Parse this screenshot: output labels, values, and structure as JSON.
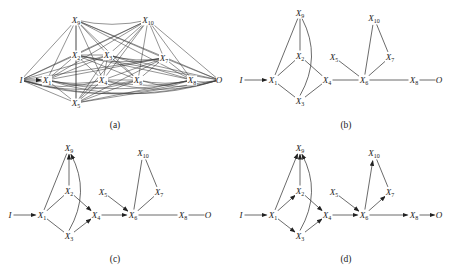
{
  "figure": {
    "panels": [
      {
        "id": "a",
        "caption": "(a)",
        "description": "fully connected graph",
        "nodes": [
          {
            "id": "I",
            "label": "I",
            "sub": ""
          },
          {
            "id": "X1",
            "label": "X",
            "sub": "1"
          },
          {
            "id": "X2",
            "label": "X",
            "sub": "2"
          },
          {
            "id": "X3",
            "label": "X",
            "sub": "3"
          },
          {
            "id": "X4",
            "label": "X",
            "sub": "4"
          },
          {
            "id": "X5",
            "label": "X",
            "sub": "5"
          },
          {
            "id": "X6",
            "label": "X",
            "sub": "6"
          },
          {
            "id": "X7",
            "label": "X",
            "sub": "7"
          },
          {
            "id": "X8",
            "label": "X",
            "sub": "8"
          },
          {
            "id": "X9",
            "label": "X",
            "sub": "9"
          },
          {
            "id": "X10",
            "label": "X",
            "sub": "10"
          },
          {
            "id": "O",
            "label": "O",
            "sub": ""
          }
        ],
        "edges": "complete",
        "directed_edges": [
          [
            "I",
            "X1"
          ]
        ]
      },
      {
        "id": "b",
        "caption": "(b)",
        "description": "undirected skeleton",
        "nodes": [
          {
            "id": "I",
            "label": "I",
            "sub": ""
          },
          {
            "id": "X1",
            "label": "X",
            "sub": "1"
          },
          {
            "id": "X2",
            "label": "X",
            "sub": "2"
          },
          {
            "id": "X3",
            "label": "X",
            "sub": "3"
          },
          {
            "id": "X4",
            "label": "X",
            "sub": "4"
          },
          {
            "id": "X5",
            "label": "X",
            "sub": "5"
          },
          {
            "id": "X6",
            "label": "X",
            "sub": "6"
          },
          {
            "id": "X7",
            "label": "X",
            "sub": "7"
          },
          {
            "id": "X8",
            "label": "X",
            "sub": "8"
          },
          {
            "id": "X9",
            "label": "X",
            "sub": "9"
          },
          {
            "id": "X10",
            "label": "X",
            "sub": "10"
          },
          {
            "id": "O",
            "label": "O",
            "sub": ""
          }
        ],
        "edges": [
          {
            "from": "I",
            "to": "X1",
            "directed": true
          },
          {
            "from": "X1",
            "to": "X9",
            "directed": false
          },
          {
            "from": "X2",
            "to": "X9",
            "directed": false
          },
          {
            "from": "X3",
            "to": "X9",
            "directed": false,
            "curved": true
          },
          {
            "from": "X1",
            "to": "X2",
            "directed": false
          },
          {
            "from": "X1",
            "to": "X3",
            "directed": false
          },
          {
            "from": "X2",
            "to": "X4",
            "directed": false
          },
          {
            "from": "X3",
            "to": "X4",
            "directed": false
          },
          {
            "from": "X4",
            "to": "X6",
            "directed": false
          },
          {
            "from": "X5",
            "to": "X6",
            "directed": false
          },
          {
            "from": "X6",
            "to": "X10",
            "directed": false
          },
          {
            "from": "X6",
            "to": "X7",
            "directed": false
          },
          {
            "from": "X7",
            "to": "X10",
            "directed": false
          },
          {
            "from": "X6",
            "to": "X8",
            "directed": false
          },
          {
            "from": "X8",
            "to": "O",
            "directed": false
          }
        ]
      },
      {
        "id": "c",
        "caption": "(c)",
        "description": "partially oriented graph",
        "nodes": [
          {
            "id": "I",
            "label": "I",
            "sub": ""
          },
          {
            "id": "X1",
            "label": "X",
            "sub": "1"
          },
          {
            "id": "X2",
            "label": "X",
            "sub": "2"
          },
          {
            "id": "X3",
            "label": "X",
            "sub": "3"
          },
          {
            "id": "X4",
            "label": "X",
            "sub": "4"
          },
          {
            "id": "X5",
            "label": "X",
            "sub": "5"
          },
          {
            "id": "X6",
            "label": "X",
            "sub": "6"
          },
          {
            "id": "X7",
            "label": "X",
            "sub": "7"
          },
          {
            "id": "X8",
            "label": "X",
            "sub": "8"
          },
          {
            "id": "X9",
            "label": "X",
            "sub": "9"
          },
          {
            "id": "X10",
            "label": "X",
            "sub": "10"
          },
          {
            "id": "O",
            "label": "O",
            "sub": ""
          }
        ],
        "edges": [
          {
            "from": "I",
            "to": "X1",
            "directed": true
          },
          {
            "from": "X1",
            "to": "X9",
            "directed": false
          },
          {
            "from": "X2",
            "to": "X9",
            "directed": true
          },
          {
            "from": "X3",
            "to": "X9",
            "directed": true,
            "curved": true
          },
          {
            "from": "X1",
            "to": "X2",
            "directed": false
          },
          {
            "from": "X1",
            "to": "X3",
            "directed": false
          },
          {
            "from": "X2",
            "to": "X4",
            "directed": true
          },
          {
            "from": "X3",
            "to": "X4",
            "directed": true
          },
          {
            "from": "X4",
            "to": "X6",
            "directed": true
          },
          {
            "from": "X5",
            "to": "X6",
            "directed": true
          },
          {
            "from": "X6",
            "to": "X10",
            "directed": false
          },
          {
            "from": "X6",
            "to": "X7",
            "directed": false
          },
          {
            "from": "X7",
            "to": "X10",
            "directed": false
          },
          {
            "from": "X6",
            "to": "X8",
            "directed": false
          },
          {
            "from": "X8",
            "to": "O",
            "directed": false
          }
        ]
      },
      {
        "id": "d",
        "caption": "(d)",
        "description": "fully oriented DAG",
        "nodes": [
          {
            "id": "I",
            "label": "I",
            "sub": ""
          },
          {
            "id": "X1",
            "label": "X",
            "sub": "1"
          },
          {
            "id": "X2",
            "label": "X",
            "sub": "2"
          },
          {
            "id": "X3",
            "label": "X",
            "sub": "3"
          },
          {
            "id": "X4",
            "label": "X",
            "sub": "4"
          },
          {
            "id": "X5",
            "label": "X",
            "sub": "5"
          },
          {
            "id": "X6",
            "label": "X",
            "sub": "6"
          },
          {
            "id": "X7",
            "label": "X",
            "sub": "7"
          },
          {
            "id": "X8",
            "label": "X",
            "sub": "8"
          },
          {
            "id": "X9",
            "label": "X",
            "sub": "9"
          },
          {
            "id": "X10",
            "label": "X",
            "sub": "10"
          },
          {
            "id": "O",
            "label": "O",
            "sub": ""
          }
        ],
        "edges": [
          {
            "from": "I",
            "to": "X1",
            "directed": true
          },
          {
            "from": "X1",
            "to": "X9",
            "directed": true
          },
          {
            "from": "X2",
            "to": "X9",
            "directed": true
          },
          {
            "from": "X3",
            "to": "X9",
            "directed": true,
            "curved": true
          },
          {
            "from": "X1",
            "to": "X2",
            "directed": true
          },
          {
            "from": "X1",
            "to": "X3",
            "directed": true
          },
          {
            "from": "X2",
            "to": "X4",
            "directed": true
          },
          {
            "from": "X3",
            "to": "X4",
            "directed": true
          },
          {
            "from": "X4",
            "to": "X6",
            "directed": true
          },
          {
            "from": "X5",
            "to": "X6",
            "directed": true
          },
          {
            "from": "X6",
            "to": "X10",
            "directed": true
          },
          {
            "from": "X6",
            "to": "X7",
            "directed": true
          },
          {
            "from": "X7",
            "to": "X10",
            "directed": false
          },
          {
            "from": "X6",
            "to": "X8",
            "directed": true
          },
          {
            "from": "X8",
            "to": "O",
            "directed": true
          }
        ]
      }
    ]
  }
}
